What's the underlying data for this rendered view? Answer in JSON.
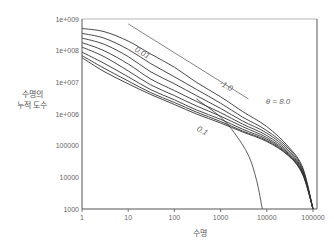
{
  "chart_data": {
    "type": "line",
    "title": "",
    "xlabel": "수명",
    "ylabel": [
      "수명의",
      "누적 도수"
    ],
    "xscale": "log",
    "yscale": "log",
    "xlim": [
      1,
      100000
    ],
    "ylim": [
      1000,
      1000000000
    ],
    "xticks": [
      "1",
      "10",
      "100",
      "1000",
      "10000",
      "100000"
    ],
    "yticks": [
      "1e+009",
      "1e+008",
      "1e+007",
      "1e+006",
      "100000",
      "10000",
      "1000"
    ],
    "grid": false,
    "annotations": [
      {
        "text": "0.01",
        "x": 60,
        "y": 60000000,
        "rotation": 28
      },
      {
        "text": "-1.0",
        "x": 9000,
        "y": 5000000,
        "rotation": 28
      },
      {
        "text": "θ = 8.0",
        "x": 30000,
        "y": 4000000
      },
      {
        "text": "0.1",
        "x": 1000,
        "y": 400000,
        "rotation": 28
      }
    ],
    "series": [
      {
        "name": "0.01",
        "x": [
          1,
          3,
          10,
          30,
          100,
          300,
          1000,
          3000,
          10000,
          30000,
          60000,
          100000
        ],
        "y": [
          500000000,
          400000000,
          200000000,
          80000000,
          30000000,
          10000000,
          3500000,
          1200000,
          400000,
          90000,
          20000,
          1000
        ]
      },
      {
        "name": "curve-2",
        "x": [
          1,
          3,
          10,
          30,
          100,
          300,
          1000,
          3000,
          10000,
          30000,
          60000,
          100000
        ],
        "y": [
          350000000,
          250000000,
          110000000,
          40000000,
          15000000,
          6000000,
          2200000,
          800000,
          300000,
          80000,
          18000,
          1000
        ]
      },
      {
        "name": "curve-3",
        "x": [
          1,
          3,
          10,
          30,
          100,
          300,
          1000,
          3000,
          10000,
          30000,
          60000,
          100000
        ],
        "y": [
          250000000,
          160000000,
          65000000,
          22000000,
          9000000,
          3800000,
          1500000,
          600000,
          250000,
          70000,
          16000,
          1000
        ]
      },
      {
        "name": "curve-4",
        "x": [
          1,
          3,
          10,
          30,
          100,
          300,
          1000,
          3000,
          10000,
          30000,
          60000,
          100000
        ],
        "y": [
          180000000,
          100000000,
          38000000,
          13000000,
          5500000,
          2500000,
          1100000,
          480000,
          210000,
          62000,
          15000,
          1000
        ]
      },
      {
        "name": "curve-5",
        "x": [
          1,
          3,
          10,
          30,
          100,
          300,
          1000,
          3000,
          10000,
          30000,
          60000,
          100000
        ],
        "y": [
          130000000,
          65000000,
          23000000,
          8500000,
          3800000,
          1800000,
          850000,
          400000,
          180000,
          56000,
          14000,
          1000
        ]
      },
      {
        "name": "curve-6",
        "x": [
          1,
          3,
          10,
          30,
          100,
          300,
          1000,
          3000,
          10000,
          30000,
          60000,
          100000
        ],
        "y": [
          90000000,
          40000000,
          15000000,
          6000000,
          2800000,
          1350000,
          680000,
          330000,
          160000,
          52000,
          13000,
          1000
        ]
      },
      {
        "name": "curve-7",
        "x": [
          1,
          3,
          10,
          30,
          100,
          300,
          1000,
          3000,
          10000,
          30000,
          60000,
          100000
        ],
        "y": [
          70000000,
          28000000,
          11000000,
          4800000,
          2300000,
          1150000,
          580000,
          290000,
          145000,
          49000,
          12500,
          1000
        ]
      },
      {
        "name": "0.1",
        "x": [
          1,
          3,
          10,
          30,
          100,
          300,
          1000,
          3000,
          10000,
          30000,
          60000,
          100000
        ],
        "y": [
          60000000,
          22000000,
          9000000,
          4200000,
          2000000,
          1000000,
          520000,
          270000,
          135000,
          47000,
          12000,
          1000
        ]
      },
      {
        "name": "reference slope -1.0",
        "x": [
          10,
          4000
        ],
        "y": [
          700000000,
          3000000
        ]
      },
      {
        "name": "steep cutoff",
        "x": [
          300,
          1000,
          2000,
          4000,
          6000,
          8000
        ],
        "y": [
          3000000,
          800000,
          250000,
          50000,
          8000,
          1000
        ]
      }
    ]
  }
}
